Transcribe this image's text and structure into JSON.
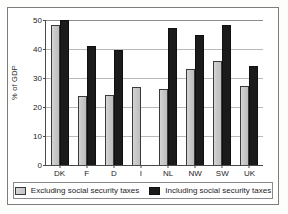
{
  "chart_data": {
    "type": "bar",
    "title": "",
    "xlabel": "",
    "ylabel": "% of GDP",
    "ylim": [
      0,
      50
    ],
    "yticks": [
      0,
      10,
      20,
      30,
      40,
      50
    ],
    "grid": true,
    "legend_position": "bottom",
    "categories": [
      "DK",
      "F",
      "D",
      "I",
      "NL",
      "NW",
      "SW",
      "UK"
    ],
    "series": [
      {
        "name": "Excluding social security taxes",
        "color": "#c9c9c9",
        "values": [
          48.3,
          23.8,
          24.0,
          27.0,
          26.3,
          33.0,
          35.8,
          27.4
        ]
      },
      {
        "name": "Including social security taxes",
        "color": "#1b1b1b",
        "values": [
          50.0,
          41.0,
          39.5,
          null,
          47.3,
          44.7,
          48.2,
          34.0
        ]
      }
    ]
  }
}
